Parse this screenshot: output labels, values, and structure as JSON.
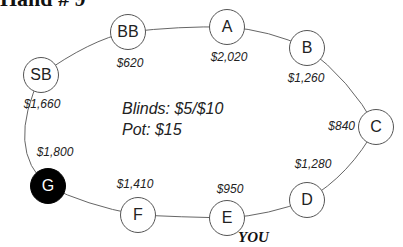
{
  "title": "Hand # 9",
  "info": {
    "blinds": "Blinds: $5/$10",
    "pot": "Pot: $15"
  },
  "hero_label": "YOU",
  "seats": [
    {
      "id": "BB",
      "stack": "$620",
      "dealer": false
    },
    {
      "id": "A",
      "stack": "$2,020",
      "dealer": false
    },
    {
      "id": "B",
      "stack": "$1,260",
      "dealer": false
    },
    {
      "id": "SB",
      "stack": "$1,660",
      "dealer": false
    },
    {
      "id": "C",
      "stack": "$840",
      "dealer": false
    },
    {
      "id": "D",
      "stack": "$1,280",
      "dealer": false
    },
    {
      "id": "E",
      "stack": "$950",
      "dealer": false,
      "hero": true
    },
    {
      "id": "F",
      "stack": "$1,410",
      "dealer": false
    },
    {
      "id": "G",
      "stack": "$1,800",
      "dealer": true
    }
  ],
  "colors": {
    "dealer_fill": "#000000",
    "seat_border": "#555555",
    "line": "#666666"
  }
}
